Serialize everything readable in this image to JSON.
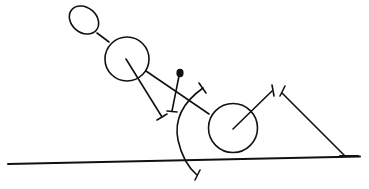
{
  "diagram": {
    "type": "line-drawing",
    "colors": {
      "background": "#ffffff",
      "ink": "#111111"
    },
    "elements": [
      {
        "id": "head",
        "shape": "ellipse"
      },
      {
        "id": "neck",
        "shape": "line"
      },
      {
        "id": "torso",
        "shape": "circle"
      },
      {
        "id": "torso-inner-line",
        "shape": "line-with-end-tick"
      },
      {
        "id": "arm-line",
        "shape": "line"
      },
      {
        "id": "pendulum",
        "shape": "rod-with-dot-and-end-tick"
      },
      {
        "id": "rotation-arc",
        "shape": "arc-with-end-ticks"
      },
      {
        "id": "wheel",
        "shape": "circle"
      },
      {
        "id": "wheel-spoke",
        "shape": "line-with-end-tick"
      },
      {
        "id": "support-line",
        "shape": "line-with-tick"
      },
      {
        "id": "ground-line",
        "shape": "line"
      }
    ],
    "labels": []
  }
}
